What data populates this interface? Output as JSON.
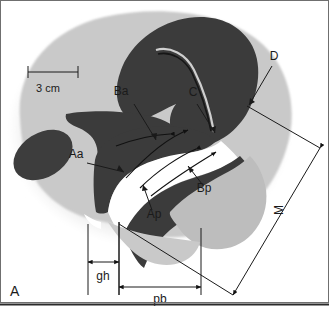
{
  "figure": {
    "panel_label": "A",
    "scale_bar_label": "3 cm",
    "background_color": "#ffffff",
    "frame_color": "#333333"
  },
  "colors": {
    "body_soft_tissue": "#c9c9c9",
    "dark_organ": "#3a3a3a",
    "mid_organ": "#b4b4b4",
    "halo": "#e2e2e2",
    "line": "#1a1a1a",
    "white_gap": "#ffffff"
  },
  "labels": [
    {
      "id": "Ba",
      "text": "Ba",
      "x": 121,
      "y": 95,
      "name": "label-ba"
    },
    {
      "id": "C",
      "text": "C",
      "x": 193,
      "y": 96,
      "name": "label-c"
    },
    {
      "id": "D",
      "text": "D",
      "x": 274,
      "y": 60,
      "name": "label-d"
    },
    {
      "id": "Aa",
      "text": "Aa",
      "x": 76,
      "y": 158,
      "name": "label-aa"
    },
    {
      "id": "Ap",
      "text": "Ap",
      "x": 154,
      "y": 218,
      "name": "label-ap"
    },
    {
      "id": "Bp",
      "text": "Bp",
      "x": 204,
      "y": 192,
      "name": "label-bp"
    }
  ],
  "measurements": [
    {
      "id": "gh",
      "text": "gh",
      "name": "measure-gh",
      "x": 101,
      "y": 274
    },
    {
      "id": "pb",
      "text": "pb",
      "name": "measure-pb",
      "x": 155,
      "y": 295
    },
    {
      "id": "M",
      "text": "M",
      "name": "measure-m",
      "x": 283,
      "y": 208
    }
  ],
  "anatomy_regions": [
    {
      "name": "pelvic-soft-tissue",
      "label": "body soft tissue outline"
    },
    {
      "name": "uterus",
      "label": "uterus / dark organ body"
    },
    {
      "name": "uterine-cavity",
      "label": "uterine cavity line (C)"
    },
    {
      "name": "bladder",
      "label": "bladder (mid-gray anterior structure)"
    },
    {
      "name": "pubic-bone",
      "label": "pubic bone (left dark ellipse)"
    },
    {
      "name": "vaginal-wall-anterior",
      "label": "anterior vaginal wall (Aa / Ba)"
    },
    {
      "name": "vaginal-wall-posterior",
      "label": "posterior vaginal wall (Ap / Bp)"
    },
    {
      "name": "rectum",
      "label": "rectum (posterior mid-gray structure)"
    },
    {
      "name": "cervix-point",
      "label": "point D"
    }
  ]
}
